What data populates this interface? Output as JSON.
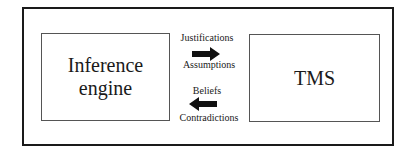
{
  "diagram": {
    "left_box": {
      "line1": "Inference",
      "line2": "engine"
    },
    "right_box": {
      "label": "TMS"
    },
    "top_flow": {
      "direction": "right",
      "label_above": "Justifications",
      "label_below": "Assumptions"
    },
    "bottom_flow": {
      "direction": "left",
      "label_above": "Beliefs",
      "label_below": "Contradictions"
    }
  }
}
